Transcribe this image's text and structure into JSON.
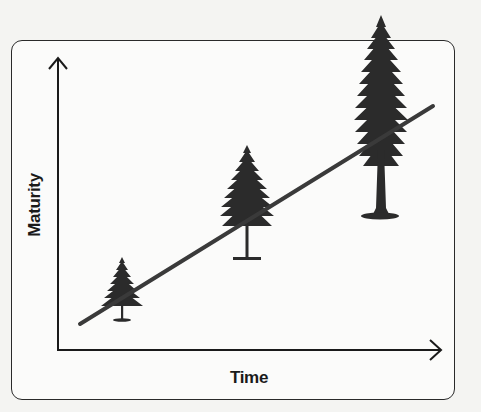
{
  "diagram": {
    "title": "",
    "axes": {
      "y_label": "Maturity",
      "x_label": "Time"
    },
    "trend_line": {
      "description": "Straight line rising from lower-left to upper-right",
      "color": "#3a3a3a"
    },
    "trees": [
      {
        "name": "young-tree",
        "stage": "small"
      },
      {
        "name": "middle-tree",
        "stage": "medium"
      },
      {
        "name": "mature-tree",
        "stage": "tall"
      }
    ],
    "colors": {
      "background": "#f4f4f2",
      "frame": "#2a2a2a",
      "tree": "#2b2b2b",
      "axes": "#1a1a1a"
    }
  }
}
